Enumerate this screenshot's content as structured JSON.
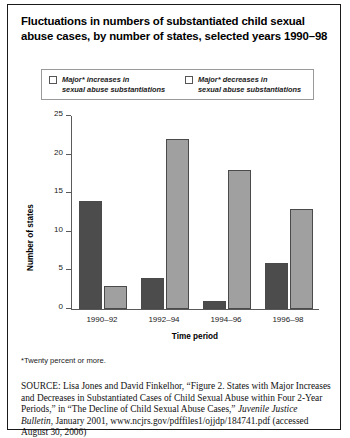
{
  "figure": {
    "title": "Fluctuations in numbers of substantiated child sexual abuse cases, by number of states, selected years 1990–98",
    "footnote": "*Twenty percent or more.",
    "source_label": "SOURCE:",
    "source_part1": " Lisa Jones and David Finkelhor, “Figure 2. States with Major Increases and Decreases in Substantiated Cases of Child Sexual Abuse within Four 2-Year Periods,” in “The Decline of Child Sexual Abuse Cases,” ",
    "source_italic": "Juvenile Justice Bulletin",
    "source_part2": ", January 2001, www.ncjrs.gov/pdffiles1/ojjdp/184741.pdf (accessed August 30, 2006)"
  },
  "colors": {
    "major_increases": "#4c4c4c",
    "major_decreases": "#a0a0a0",
    "axis": "#5a5a5a",
    "frame": "#1a1a1a"
  },
  "chart_data": {
    "type": "bar",
    "title": "Fluctuations in numbers of substantiated child sexual abuse cases, by number of states, selected years 1990–98",
    "xlabel": "Time period",
    "ylabel": "Number of states",
    "categories": [
      "1990–92",
      "1992–94",
      "1994–96",
      "1996–98"
    ],
    "series": [
      {
        "name": "Major* increases in\nsexual abuse substantiations",
        "color": "#4c4c4c",
        "values": [
          14,
          4,
          1,
          6
        ]
      },
      {
        "name": "Major* decreases in\nsexual abuse substantiations",
        "color": "#a0a0a0",
        "values": [
          3,
          22,
          18,
          13
        ]
      }
    ],
    "ylim": [
      0,
      25
    ],
    "yticks": [
      0,
      5,
      10,
      15,
      20,
      25
    ],
    "ytick_labels": [
      "0",
      "5",
      "10",
      "15",
      "20",
      "25"
    ],
    "grid": false,
    "legend_position": "top"
  }
}
